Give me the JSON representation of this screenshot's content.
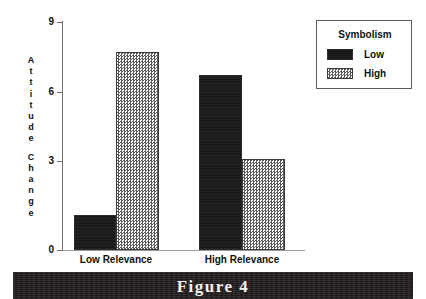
{
  "figure": {
    "caption": "Figure 4"
  },
  "chart_data": {
    "type": "bar",
    "title": "",
    "xlabel": "",
    "ylabel": "Attitude Change",
    "ylim": [
      0,
      9
    ],
    "yticks": [
      0,
      3,
      6,
      9
    ],
    "ytick_labels": [
      "0",
      "3",
      "6",
      "9"
    ],
    "grid": false,
    "categories": [
      "Low Relevance",
      "High Relevance"
    ],
    "series": [
      {
        "name": "Low",
        "values": [
          1.4,
          6.9
        ],
        "color": "#1a1a1a",
        "pattern": "solid-black"
      },
      {
        "name": "High",
        "values": [
          7.8,
          3.6
        ],
        "color": "#d8d8d8",
        "pattern": "checkered"
      }
    ],
    "legend": {
      "title": "Symbolism",
      "position": "top-right",
      "entries": [
        {
          "label": "Low",
          "swatch": "solid-black"
        },
        {
          "label": "High",
          "swatch": "checkered"
        }
      ]
    }
  }
}
